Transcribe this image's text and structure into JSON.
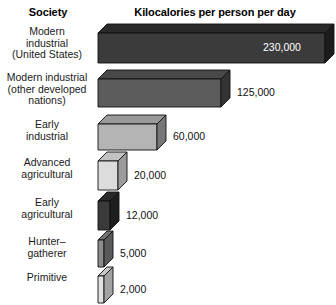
{
  "header": {
    "society_label": "Society",
    "value_axis_label": "Kilocalories per person per day"
  },
  "chart_data": {
    "type": "bar",
    "title": "Kilocalories per person per day",
    "xlabel": "Kilocalories per person per day",
    "ylabel": "Society",
    "orientation": "horizontal",
    "style": "3d-isometric-blocks",
    "grid": false,
    "legend": false,
    "xlim": [
      0,
      230000
    ],
    "categories": [
      "Modern industrial (United States)",
      "Modern industrial (other developed nations)",
      "Early industrial",
      "Advanced agricultural",
      "Early agricultural",
      "Hunter–gatherer",
      "Primitive"
    ],
    "values": [
      230000,
      125000,
      60000,
      20000,
      12000,
      5000,
      2000
    ],
    "value_labels": [
      "230,000",
      "125,000",
      "60,000",
      "20,000",
      "12,000",
      "5,000",
      "2,000"
    ]
  },
  "rows": [
    {
      "label_lines": [
        "Modern",
        "industrial",
        "(United States)"
      ],
      "value": 230000,
      "value_label": "230,000",
      "label_inside": true,
      "face": "#3b3b3b",
      "top": "#2a2a2a",
      "side": "#1c1c1c"
    },
    {
      "label_lines": [
        "Modern industrial",
        "(other developed",
        "nations)"
      ],
      "value": 125000,
      "value_label": "125,000",
      "label_inside": false,
      "face": "#5c5c5c",
      "top": "#484848",
      "side": "#343434"
    },
    {
      "label_lines": [
        "Early",
        "industrial"
      ],
      "value": 60000,
      "value_label": "60,000",
      "label_inside": false,
      "face": "#b4b4b4",
      "top": "#9a9a9a",
      "side": "#777777"
    },
    {
      "label_lines": [
        "Advanced",
        "agricultural"
      ],
      "value": 20000,
      "value_label": "20,000",
      "label_inside": false,
      "face": "#dcdcdc",
      "top": "#c2c2c2",
      "side": "#9c9c9c"
    },
    {
      "label_lines": [
        "Early",
        "agricultural"
      ],
      "value": 12000,
      "value_label": "12,000",
      "label_inside": false,
      "face": "#3a3a3a",
      "top": "#2b2b2b",
      "side": "#1e1e1e"
    },
    {
      "label_lines": [
        "Hunter–",
        "gatherer"
      ],
      "value": 5000,
      "value_label": "5,000",
      "label_inside": false,
      "face": "#8d8d8d",
      "top": "#747474",
      "side": "#5a5a5a"
    },
    {
      "label_lines": [
        "Primitive"
      ],
      "value": 2000,
      "value_label": "2,000",
      "label_inside": false,
      "face": "#e2e2e2",
      "top": "#c8c8c8",
      "side": "#a2a2a2"
    }
  ],
  "colors": {
    "background": "#ffffff",
    "text": "#1a1a1a",
    "inside_label_text": "#ffffff",
    "outline": "#111111"
  }
}
